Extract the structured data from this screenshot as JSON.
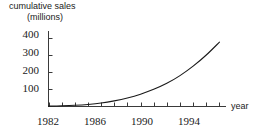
{
  "chart_data": {
    "type": "line",
    "title": "",
    "ylabel": "cumulative sales (millions)",
    "ylabel_line1": "cumulative sales",
    "ylabel_line2": "(millions)",
    "xlabel": "year",
    "xlim": [
      1982,
      1995.5
    ],
    "ylim": [
      0,
      440
    ],
    "grid": false,
    "legend": null,
    "y_ticks": [
      100,
      200,
      300,
      400
    ],
    "y_tick_labels": [
      "100",
      "200",
      "300",
      "400"
    ],
    "x_ticks": [
      1982,
      1983,
      1984,
      1985,
      1986,
      1987,
      1988,
      1989,
      1990,
      1991,
      1992,
      1993,
      1994,
      1995
    ],
    "x_tick_labels_shown": [
      "1982",
      "1986",
      "1990",
      "1994"
    ],
    "x_tick_labels_shown_at": [
      1982,
      1986,
      1990,
      1994
    ],
    "series": [
      {
        "name": "cumulative sales",
        "x": [
          1982,
          1983,
          1984,
          1985,
          1986,
          1987,
          1988,
          1989,
          1990,
          1991,
          1992,
          1993,
          1994,
          1995
        ],
        "y": [
          2,
          4,
          7,
          12,
          20,
          33,
          50,
          72,
          100,
          135,
          180,
          235,
          300,
          375
        ]
      }
    ],
    "line_color": "#1a1a1a",
    "line_width": 1
  }
}
